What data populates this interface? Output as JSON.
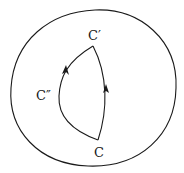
{
  "diagram": {
    "labels": {
      "top": "C′",
      "left": "C″",
      "bottom": "C"
    },
    "arrows": [
      {
        "path": "left-arc",
        "direction": "up"
      },
      {
        "path": "right-arc",
        "direction": "up"
      }
    ],
    "colors": {
      "ink": "#1a1a1a",
      "background": "#ffffff"
    }
  }
}
